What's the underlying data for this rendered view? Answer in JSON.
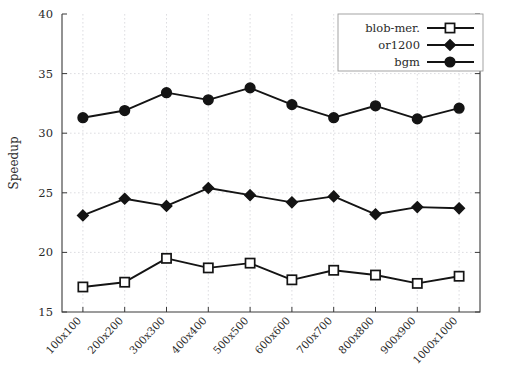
{
  "chart_data": {
    "type": "line",
    "title": "",
    "xlabel": "",
    "ylabel": "Speedup",
    "ylim": [
      15,
      40
    ],
    "yticks": [
      15,
      20,
      25,
      30,
      35,
      40
    ],
    "ytick_labels": [
      "15",
      "20",
      "25",
      "30",
      "35",
      "40"
    ],
    "grid": true,
    "legend_position": "top-right",
    "categories": [
      "100x100",
      "200x200",
      "300x300",
      "400x400",
      "500x500",
      "600x600",
      "700x700",
      "800x800",
      "900x900",
      "1000x1000"
    ],
    "series": [
      {
        "name": "blob-mer.",
        "marker": "open-square",
        "values": [
          17.1,
          17.5,
          19.5,
          18.7,
          19.1,
          17.7,
          18.5,
          18.1,
          17.4,
          18.0
        ]
      },
      {
        "name": "or1200",
        "marker": "filled-diamond",
        "values": [
          23.1,
          24.5,
          23.9,
          25.4,
          24.8,
          24.2,
          24.7,
          23.2,
          23.8,
          23.7
        ]
      },
      {
        "name": "bgm",
        "marker": "filled-circle",
        "values": [
          31.3,
          31.9,
          33.4,
          32.8,
          33.8,
          32.4,
          31.3,
          32.3,
          31.2,
          32.1
        ]
      }
    ]
  },
  "legend": {
    "entries": [
      {
        "label": "blob-mer."
      },
      {
        "label": "or1200"
      },
      {
        "label": "bgm"
      }
    ]
  },
  "colors": {
    "ink": "#141414",
    "axis": "#3a3a3a",
    "grid": "#cfcfd4",
    "background": "#ffffff"
  }
}
